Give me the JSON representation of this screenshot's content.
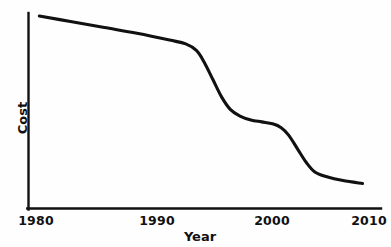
{
  "chart_data": {
    "type": "line",
    "title": "",
    "subtitle": "",
    "xlabel": "Year",
    "ylabel": "Cost",
    "xlim": [
      1978,
      2010.5
    ],
    "ylim": [
      0,
      100
    ],
    "xticks": [
      1980,
      1990,
      2000,
      2010
    ],
    "xtick_labels": [
      "1980",
      "1990",
      "2000",
      "2010"
    ],
    "yticks": [],
    "ytick_labels": [],
    "grid": false,
    "legend": null,
    "annotations": [],
    "series": [
      {
        "name": "Cost",
        "color": "#111111",
        "x": [
          1979.0,
          1982.0,
          1985.0,
          1988.0,
          1991.0,
          1992.5,
          1993.5,
          1994.2,
          1995.0,
          1995.8,
          1996.6,
          1997.5,
          1998.5,
          1999.5,
          2000.5,
          2001.3,
          2002.0,
          2002.8,
          2003.6,
          2004.4,
          2005.5,
          2007.0,
          2008.8
        ],
        "y": [
          100.0,
          97.0,
          94.0,
          91.0,
          87.5,
          85.5,
          82.0,
          76.0,
          67.0,
          58.0,
          51.5,
          48.0,
          46.0,
          45.0,
          44.0,
          42.0,
          38.0,
          31.0,
          24.0,
          19.0,
          16.5,
          14.5,
          13.0
        ]
      }
    ]
  },
  "axis": {
    "x_title": "Year",
    "y_title": "Cost",
    "x_tick_1": "1980",
    "x_tick_2": "1990",
    "x_tick_3": "2000",
    "x_tick_4": "2010"
  },
  "colors": {
    "line": "#111111",
    "axis": "#111111",
    "background": "#fefefe"
  }
}
